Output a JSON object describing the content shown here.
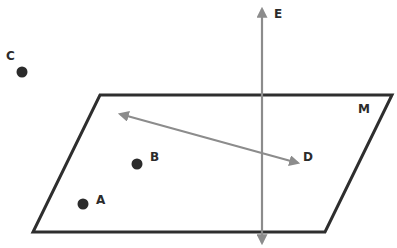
{
  "diagram": {
    "type": "geometry-plane-points-lines",
    "plane": {
      "label": "M",
      "stroke": "#2e2e2e"
    },
    "line_vertical": {
      "label": "E",
      "stroke": "#8c8c8c"
    },
    "line_in_plane": {
      "label": "D",
      "stroke": "#8c8c8c"
    },
    "points": [
      {
        "label": "A",
        "fill": "#2b2b2b"
      },
      {
        "label": "B",
        "fill": "#2b2b2b"
      },
      {
        "label": "C",
        "fill": "#2b2b2b"
      }
    ]
  }
}
